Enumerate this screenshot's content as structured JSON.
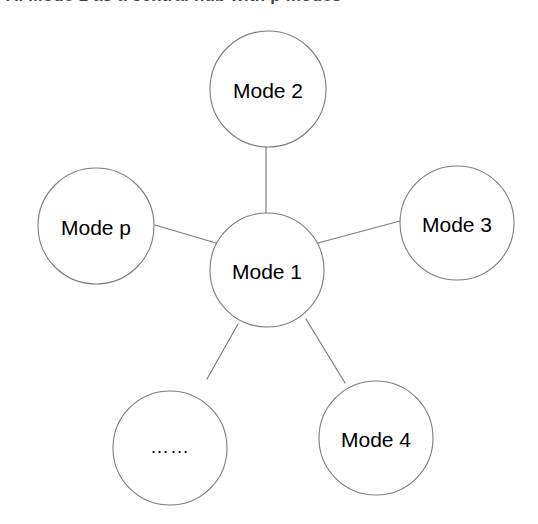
{
  "figure": {
    "heading_text": "A. Mode 1 as a central hub with p modes",
    "background_color": "#ffffff",
    "stroke_color": "#7d7d7d",
    "text_color": "#000000"
  },
  "diagram": {
    "type": "star-topology-node-graph",
    "center_node": {
      "id": "mode-1",
      "label": "Mode 1",
      "cx": 267,
      "cy": 270,
      "r": 57
    },
    "peripheral_nodes": [
      {
        "id": "mode-2",
        "label": "Mode 2",
        "cx": 268,
        "cy": 89,
        "r": 58
      },
      {
        "id": "mode-3",
        "label": "Mode 3",
        "cx": 457,
        "cy": 223,
        "r": 57
      },
      {
        "id": "mode-4",
        "label": "Mode 4",
        "cx": 376,
        "cy": 438,
        "r": 57
      },
      {
        "id": "ellipsis",
        "label": "……",
        "cx": 170,
        "cy": 448,
        "r": 57
      },
      {
        "id": "mode-p",
        "label": "Mode p",
        "cx": 96,
        "cy": 226,
        "r": 58
      }
    ],
    "edges": [
      {
        "id": "edge-center-mode-2",
        "from": "mode-1",
        "to": "mode-2",
        "x1": 266,
        "y1": 213,
        "x2": 266,
        "y2": 147
      },
      {
        "id": "edge-center-mode-3",
        "from": "mode-1",
        "to": "mode-3",
        "x1": 318,
        "y1": 243,
        "x2": 400,
        "y2": 221
      },
      {
        "id": "edge-center-mode-4",
        "from": "mode-1",
        "to": "mode-4",
        "x1": 306,
        "y1": 319,
        "x2": 345,
        "y2": 383
      },
      {
        "id": "edge-center-ellipsis",
        "from": "mode-1",
        "to": "ellipsis",
        "x1": 238,
        "y1": 324,
        "x2": 207,
        "y2": 379
      },
      {
        "id": "edge-center-mode-p",
        "from": "mode-1",
        "to": "mode-p",
        "x1": 216,
        "y1": 243,
        "x2": 155,
        "y2": 225
      }
    ]
  }
}
